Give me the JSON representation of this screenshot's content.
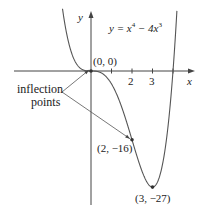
{
  "chart_data": {
    "type": "line",
    "equation_label": {
      "lhs": "y = x",
      "exp1": "4",
      "mid": " − 4x",
      "exp2": "3"
    },
    "xlabel": "x",
    "ylabel": "y",
    "x_ticks": [
      1,
      2,
      3,
      4
    ],
    "x_tick_labels": [
      "",
      "2",
      "3",
      ""
    ],
    "xlim": [
      -4.4,
      5.2
    ],
    "ylim": [
      -33,
      15
    ],
    "series": [
      {
        "name": "y = x^4 - 4x^3",
        "function": "x^4 - 4x^3",
        "color": "#555555"
      }
    ],
    "points": [
      {
        "x": 0,
        "y": 0,
        "label": "(0, 0)"
      },
      {
        "x": 2,
        "y": -16,
        "label": "(2, −16)"
      },
      {
        "x": 3,
        "y": -27,
        "label": "(3, −27)"
      }
    ],
    "annotations": [
      {
        "text": "inflection points",
        "line1": "inflection",
        "line2": "points",
        "targets": [
          [
            0,
            0
          ],
          [
            2,
            -16
          ]
        ]
      }
    ]
  }
}
